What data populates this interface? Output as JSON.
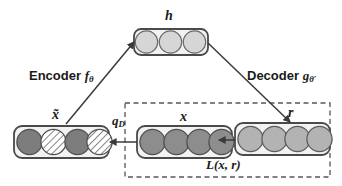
{
  "diagram": {
    "nodes": {
      "hidden": {
        "label": "h",
        "name": "hidden-representation",
        "units": 3,
        "fill": "#d6d6d6",
        "box": {
          "x": 134,
          "y": 29,
          "w": 74,
          "h": 26
        }
      },
      "corrupted_input": {
        "label": "x̃",
        "name": "corrupted-input",
        "units": 4,
        "unit_styles": [
          "solid",
          "hatched",
          "solid",
          "hatched"
        ],
        "fill": "#7d7d7d",
        "box": {
          "x": 14,
          "y": 126,
          "w": 95,
          "h": 32
        }
      },
      "input": {
        "label": "x",
        "name": "clean-input",
        "units": 4,
        "unit_styles": [
          "solid",
          "solid",
          "solid",
          "solid"
        ],
        "fill": "#8d8d8d",
        "box": {
          "x": 137,
          "y": 126,
          "w": 95,
          "h": 32
        }
      },
      "reconstruction": {
        "label": "r",
        "name": "reconstruction",
        "units": 4,
        "unit_styles": [
          "solid",
          "solid",
          "solid",
          "solid"
        ],
        "fill": "#b3b3b3",
        "box": {
          "x": 235,
          "y": 123,
          "w": 95,
          "h": 32
        }
      }
    },
    "edges": {
      "encoder": {
        "label_prefix": "Encoder",
        "symbol": "f",
        "subscript": "θ"
      },
      "decoder": {
        "label_prefix": "Decoder",
        "symbol": "g",
        "subscript": "θ′"
      },
      "corruption": {
        "symbol": "q",
        "subscript": "D"
      },
      "loss": {
        "text": "L(x, r)"
      }
    },
    "loss_region": {
      "name": "loss-region",
      "style": "dashed",
      "box": {
        "x": 125,
        "y": 103,
        "w": 205,
        "h": 74
      }
    },
    "colors": {
      "stroke": "#4a4a4a",
      "box_fill": "#f2f2f2",
      "text": "#1a1a1a",
      "hidden_unit": "#d6d6d6",
      "input_unit": "#8d8d8d",
      "corrupted_unit": "#7d7d7d",
      "reconstruction_unit": "#b3b3b3",
      "hatch": "#ffffff",
      "dashed_border": "#555555"
    }
  }
}
